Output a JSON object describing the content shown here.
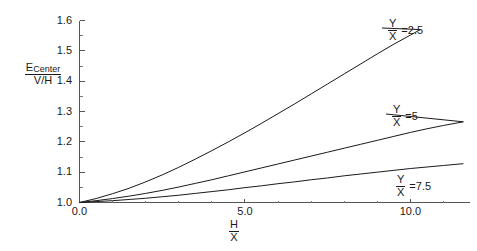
{
  "chart_data": {
    "type": "line",
    "title": "",
    "xlabel": "H/X",
    "ylabel": "E_Center/(V/H)",
    "xlim": [
      0.0,
      11.8
    ],
    "ylim": [
      1.0,
      1.6
    ],
    "grid": false,
    "legend_position": "inline-right-of-curve-ends",
    "x_ticks": [
      0.0,
      5.0,
      10.0
    ],
    "x_tick_labels": [
      "0.0",
      "5.0",
      "10.0"
    ],
    "x_minor_tick_count_between": 4,
    "y_ticks": [
      1.0,
      1.1,
      1.2,
      1.3,
      1.4,
      1.5,
      1.6
    ],
    "y_tick_labels": [
      "1.0",
      "1.1",
      "1.2",
      "1.3",
      "1.4",
      "1.5",
      "1.6"
    ],
    "y_minor_tick_count_between": 1,
    "series": [
      {
        "name": "Y/X = 2.5",
        "label_numerator": "Y",
        "label_denominator": "X",
        "label_value": "=2.5",
        "x": [
          0.0,
          0.5,
          1.0,
          1.5,
          2.0,
          2.5,
          3.0,
          3.5,
          4.0,
          4.5,
          5.0,
          5.5,
          6.0,
          6.5,
          7.0,
          7.5,
          8.0,
          8.5,
          9.0,
          9.5,
          10.0,
          10.3
        ],
        "values": [
          1.0,
          1.013,
          1.029,
          1.047,
          1.068,
          1.091,
          1.116,
          1.143,
          1.171,
          1.2,
          1.23,
          1.261,
          1.293,
          1.325,
          1.358,
          1.391,
          1.424,
          1.457,
          1.49,
          1.522,
          1.552,
          1.57
        ]
      },
      {
        "name": "Y/X = 5",
        "label_numerator": "Y",
        "label_denominator": "X",
        "label_value": "=5",
        "x": [
          0.0,
          0.5,
          1.0,
          1.5,
          2.0,
          2.5,
          3.0,
          3.5,
          4.0,
          4.5,
          5.0,
          5.5,
          6.0,
          6.5,
          7.0,
          7.5,
          8.0,
          8.5,
          9.0,
          9.5,
          10.0,
          10.5,
          11.0,
          11.6
        ],
        "values": [
          1.0,
          1.006,
          1.013,
          1.021,
          1.03,
          1.04,
          1.051,
          1.063,
          1.075,
          1.088,
          1.101,
          1.114,
          1.127,
          1.14,
          1.153,
          1.166,
          1.179,
          1.192,
          1.205,
          1.218,
          1.231,
          1.243,
          1.254,
          1.266
        ]
      },
      {
        "name": "Y/X = 7.5",
        "label_numerator": "Y",
        "label_denominator": "X",
        "label_value": "=7.5",
        "x": [
          0.0,
          0.5,
          1.0,
          1.5,
          2.0,
          2.5,
          3.0,
          3.5,
          4.0,
          4.5,
          5.0,
          5.5,
          6.0,
          6.5,
          7.0,
          7.5,
          8.0,
          8.5,
          9.0,
          9.5,
          10.0,
          10.5,
          11.0,
          11.6
        ],
        "values": [
          1.0,
          1.003,
          1.006,
          1.01,
          1.014,
          1.019,
          1.024,
          1.03,
          1.036,
          1.042,
          1.049,
          1.055,
          1.062,
          1.068,
          1.075,
          1.081,
          1.088,
          1.094,
          1.1,
          1.106,
          1.112,
          1.117,
          1.122,
          1.128
        ]
      }
    ]
  },
  "axis_titles": {
    "y_main": "E",
    "y_sub": "Center",
    "y_den": "V/H",
    "x_num": "H",
    "x_den": "X"
  },
  "colors": {
    "curve": "#1a1a1a",
    "axis": "#555555",
    "background": "#ffffff"
  }
}
